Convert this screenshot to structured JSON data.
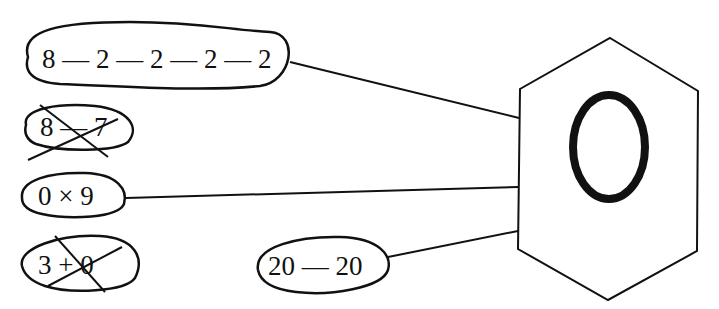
{
  "diagram": {
    "target": {
      "shape": "hexagon",
      "value": "0"
    },
    "expressions": [
      {
        "id": "e1",
        "text": "8 — 2 — 2 — 2 — 2",
        "crossed_out": false,
        "connected": true
      },
      {
        "id": "e2",
        "text": "8 — 7",
        "crossed_out": true,
        "connected": false
      },
      {
        "id": "e3",
        "text": "0 × 9",
        "crossed_out": false,
        "connected": true
      },
      {
        "id": "e4",
        "text": "3 + 0",
        "crossed_out": true,
        "connected": false
      },
      {
        "id": "e5",
        "text": "20 — 20",
        "crossed_out": false,
        "connected": true
      }
    ],
    "stroke_color": "#111111"
  }
}
